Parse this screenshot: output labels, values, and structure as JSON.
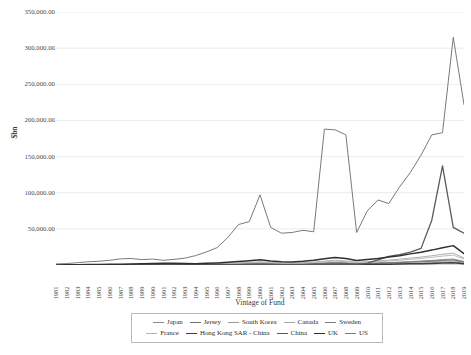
{
  "chart_data": {
    "type": "line",
    "title": "",
    "xlabel": "Vintage of Fund",
    "ylabel": "$bn",
    "grid": true,
    "legend_position": "bottom",
    "ylim": [
      0,
      350000
    ],
    "yticks": [
      50000,
      100000,
      150000,
      200000,
      250000,
      300000,
      350000
    ],
    "ytick_labels": [
      "50,000.00",
      "100,000.00",
      "150,000.00",
      "200,000.00",
      "250,000.00",
      "300,000.00",
      "350,000.00"
    ],
    "categories": [
      "1981",
      "1982",
      "1983",
      "1984",
      "1985",
      "1986",
      "1987",
      "1988",
      "1989",
      "1990",
      "1991",
      "1992",
      "1993",
      "1994",
      "1995",
      "1996",
      "1997",
      "1998",
      "1999",
      "2000",
      "2001",
      "2002",
      "2003",
      "2004",
      "2005",
      "2006",
      "2007",
      "2008",
      "2009",
      "2010",
      "2011",
      "2012",
      "2013",
      "2014",
      "2015",
      "2016",
      "2017",
      "2018",
      "2019"
    ],
    "series": [
      {
        "name": "Japan",
        "color": "#8c8c8c",
        "width": 0.9,
        "values": [
          120,
          150,
          200,
          260,
          320,
          420,
          520,
          640,
          760,
          900,
          1050,
          900,
          800,
          700,
          900,
          1100,
          1400,
          1700,
          2000,
          2400,
          1800,
          1500,
          1400,
          1600,
          2000,
          2600,
          3100,
          2700,
          1900,
          2200,
          2600,
          3000,
          3400,
          3900,
          4300,
          4900,
          5400,
          5900,
          3600
        ]
      },
      {
        "name": "Jersey",
        "color": "#6f6f6f",
        "width": 0.9,
        "values": [
          60,
          70,
          90,
          120,
          160,
          210,
          280,
          360,
          450,
          560,
          680,
          600,
          520,
          480,
          600,
          780,
          980,
          1250,
          1550,
          1900,
          1500,
          1250,
          1150,
          1350,
          1750,
          2300,
          2800,
          2400,
          1700,
          2000,
          2400,
          2900,
          3400,
          4100,
          4700,
          5500,
          6400,
          7100,
          4200
        ]
      },
      {
        "name": "South Korea",
        "color": "#9a9a9a",
        "width": 0.9,
        "values": [
          30,
          40,
          50,
          70,
          90,
          120,
          160,
          210,
          260,
          330,
          400,
          350,
          310,
          280,
          360,
          460,
          580,
          740,
          920,
          1130,
          880,
          730,
          680,
          810,
          1050,
          1380,
          1680,
          1450,
          1020,
          1220,
          1450,
          1760,
          2060,
          2470,
          2830,
          3300,
          3850,
          4300,
          2500
        ]
      },
      {
        "name": "Canada",
        "color": "#a5a5a5",
        "width": 0.9,
        "values": [
          200,
          240,
          300,
          380,
          470,
          600,
          760,
          950,
          1150,
          1400,
          1700,
          1500,
          1300,
          1200,
          1500,
          1900,
          2400,
          3000,
          3700,
          4500,
          3500,
          2900,
          2700,
          3200,
          4100,
          5400,
          6500,
          5600,
          3900,
          4700,
          5600,
          6800,
          8000,
          9500,
          11000,
          12800,
          14800,
          16400,
          9700
        ]
      },
      {
        "name": "Sweden",
        "color": "#7d7d7d",
        "width": 0.9,
        "values": [
          80,
          100,
          130,
          170,
          210,
          270,
          340,
          430,
          530,
          650,
          790,
          700,
          610,
          560,
          700,
          900,
          1130,
          1440,
          1790,
          2200,
          1700,
          1420,
          1320,
          1570,
          2030,
          2670,
          3250,
          2800,
          1960,
          2350,
          2800,
          3400,
          4000,
          4760,
          5460,
          6360,
          7420,
          8290,
          4870
        ]
      },
      {
        "name": "France",
        "color": "#b4b4b4",
        "width": 0.9,
        "values": [
          150,
          180,
          230,
          290,
          360,
          460,
          580,
          730,
          890,
          1080,
          1310,
          1160,
          1010,
          930,
          1170,
          1490,
          1870,
          2390,
          2960,
          3640,
          2820,
          2350,
          2190,
          2600,
          3360,
          4410,
          5360,
          4620,
          3240,
          3890,
          4630,
          5620,
          6610,
          7870,
          9030,
          10520,
          12260,
          13700,
          8060
        ]
      },
      {
        "name": "Hong Kong SAR - China",
        "color": "#3c3c3c",
        "width": 1.5,
        "values": [
          20,
          25,
          30,
          40,
          55,
          70,
          95,
          120,
          155,
          195,
          240,
          210,
          185,
          170,
          215,
          275,
          350,
          450,
          560,
          700,
          540,
          450,
          420,
          500,
          650,
          860,
          1050,
          900,
          640,
          770,
          920,
          1120,
          1330,
          1600,
          1860,
          2200,
          2600,
          2950,
          1750
        ]
      },
      {
        "name": "China",
        "color": "#5a5a5a",
        "width": 1.3,
        "values": [
          10,
          12,
          15,
          20,
          26,
          34,
          45,
          60,
          80,
          105,
          140,
          120,
          105,
          95,
          125,
          165,
          220,
          290,
          380,
          500,
          390,
          330,
          310,
          380,
          500,
          690,
          880,
          760,
          540,
          2600,
          7200,
          11800,
          14300,
          17900,
          23000,
          62000,
          137000,
          52000,
          44000
        ]
      },
      {
        "name": "UK",
        "color": "#2f2f2f",
        "width": 1.5,
        "values": [
          300,
          360,
          450,
          570,
          710,
          900,
          1140,
          1430,
          1740,
          2120,
          2570,
          2270,
          1980,
          1820,
          2290,
          2920,
          3660,
          4680,
          5800,
          7130,
          5520,
          4600,
          4290,
          5090,
          6580,
          8640,
          10500,
          9040,
          6340,
          7600,
          9060,
          11000,
          12930,
          15400,
          17680,
          20600,
          24000,
          26800,
          15800
        ]
      },
      {
        "name": "US",
        "color": "#7a7a7a",
        "width": 1.0,
        "values": [
          1500,
          2000,
          3200,
          4500,
          5200,
          6500,
          8500,
          9000,
          7500,
          8200,
          6500,
          7800,
          9500,
          13000,
          18000,
          24000,
          38000,
          56000,
          60000,
          97000,
          52000,
          44000,
          45000,
          48000,
          46000,
          188000,
          187000,
          180000,
          45000,
          75000,
          90000,
          85000,
          108000,
          128000,
          152000,
          180000,
          183000,
          315000,
          222000
        ]
      }
    ]
  },
  "axis": {
    "ylabel_title": "$bn",
    "xlabel_title": "Vintage of Fund"
  }
}
